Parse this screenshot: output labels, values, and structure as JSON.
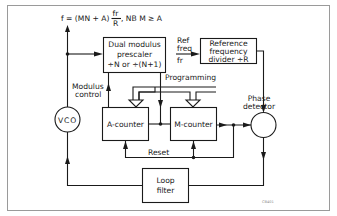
{
  "diagram": {
    "title_formula": {
      "lhs": "f = (MN + A)",
      "frac_num": "fr",
      "frac_den": "R",
      "note": ", NB  M ≥ A"
    },
    "blocks": {
      "prescaler": {
        "line1": "Dual modulus",
        "line2": "prescaler",
        "line3": "÷N or ÷(N+1)"
      },
      "ref_divider": {
        "line1": "Reference",
        "line2": "frequency",
        "line3": "divider ÷R"
      },
      "vco": {
        "label": "VCO"
      },
      "a_counter": {
        "label": "A-counter"
      },
      "m_counter": {
        "label": "M-counter"
      },
      "phase_detector": {
        "line1": "Phase",
        "line2": "detector"
      },
      "loop_filter": {
        "line1": "Loop",
        "line2": "filter"
      }
    },
    "labels": {
      "ref_freq_1": "Ref",
      "ref_freq_2": "freq",
      "ref_fr": "fr",
      "modulus_control_1": "Modulus",
      "modulus_control_2": "control",
      "programming": "Programming",
      "reset": "Reset",
      "figure_code": "CB401"
    },
    "colors": {
      "line": "#1a1a1a",
      "frame": "#9a9a9a",
      "background": "#ffffff"
    }
  }
}
